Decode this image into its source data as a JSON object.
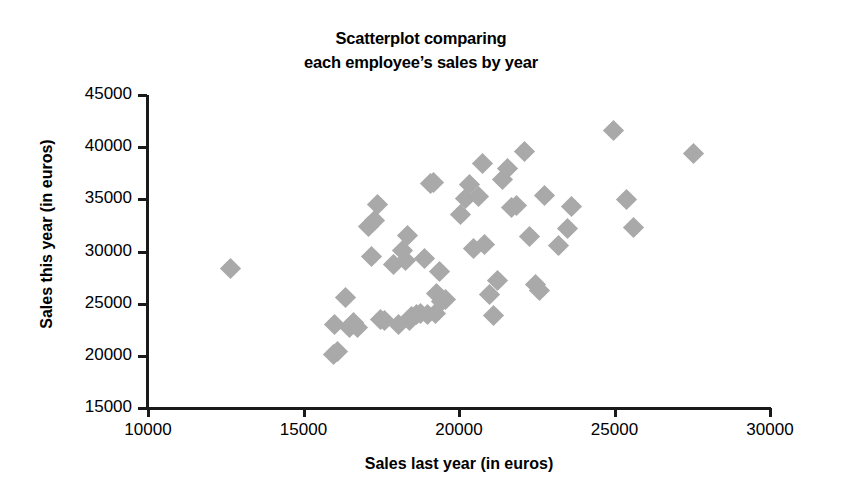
{
  "chart_data": {
    "type": "scatter",
    "title_lines": [
      "Scatterplot comparing",
      "each employee’s sales by year"
    ],
    "xlabel": "Sales last year (in euros)",
    "ylabel": "Sales this year (in euros)",
    "xlim": [
      10000,
      30000
    ],
    "ylim": [
      15000,
      45000
    ],
    "xticks": [
      10000,
      15000,
      20000,
      25000,
      30000
    ],
    "yticks": [
      15000,
      20000,
      25000,
      30000,
      35000,
      40000,
      45000
    ],
    "xticklabels": [
      "10000",
      "15000",
      "20000",
      "25000",
      "30000"
    ],
    "yticklabels": [
      "15000",
      "20000",
      "25000",
      "30000",
      "35000",
      "40000",
      "45000"
    ],
    "grid": false,
    "legend": null,
    "marker": "diamond",
    "marker_color": "#a9a9a9",
    "marker_size": 15,
    "n_points": 57,
    "x": [
      12640,
      15980,
      16010,
      16080,
      16340,
      16480,
      16620,
      16750,
      17100,
      17200,
      17290,
      17390,
      17480,
      17620,
      17900,
      18050,
      18180,
      18290,
      18340,
      18400,
      18480,
      18620,
      18750,
      18900,
      19000,
      19080,
      19180,
      19230,
      19290,
      19380,
      19450,
      19560,
      20050,
      20200,
      20340,
      20480,
      20620,
      20750,
      20820,
      20980,
      21100,
      21250,
      21400,
      21560,
      21700,
      21850,
      22100,
      22280,
      22450,
      22600,
      22750,
      23200,
      23480,
      23620,
      24980,
      25400,
      25620,
      27550
    ],
    "y": [
      28330,
      20150,
      23000,
      20400,
      25600,
      22700,
      23150,
      22750,
      32400,
      29500,
      33000,
      34500,
      23500,
      23350,
      28800,
      23050,
      30100,
      29100,
      31500,
      23400,
      23800,
      23950,
      24100,
      29350,
      24000,
      36500,
      36650,
      24050,
      26000,
      28100,
      25250,
      25400,
      33500,
      35100,
      36400,
      30250,
      35250,
      38400,
      30650,
      25900,
      23850,
      27200,
      36900,
      37950,
      34200,
      34400,
      39600,
      31400,
      26800,
      26300,
      35400,
      30600,
      32200,
      34300,
      41550,
      35000,
      32300,
      39440
    ],
    "points": [
      {
        "x": 12640,
        "y": 28330
      },
      {
        "x": 15980,
        "y": 20150
      },
      {
        "x": 16010,
        "y": 23000
      },
      {
        "x": 16080,
        "y": 20400
      },
      {
        "x": 16340,
        "y": 25600
      },
      {
        "x": 16480,
        "y": 22700
      },
      {
        "x": 16620,
        "y": 23150
      },
      {
        "x": 16750,
        "y": 22750
      },
      {
        "x": 17100,
        "y": 32400
      },
      {
        "x": 17200,
        "y": 29500
      },
      {
        "x": 17290,
        "y": 33000
      },
      {
        "x": 17390,
        "y": 34500
      },
      {
        "x": 17480,
        "y": 23500
      },
      {
        "x": 17620,
        "y": 23350
      },
      {
        "x": 17900,
        "y": 28800
      },
      {
        "x": 18050,
        "y": 23050
      },
      {
        "x": 18180,
        "y": 30100
      },
      {
        "x": 18290,
        "y": 29100
      },
      {
        "x": 18340,
        "y": 31500
      },
      {
        "x": 18400,
        "y": 23400
      },
      {
        "x": 18480,
        "y": 23800
      },
      {
        "x": 18620,
        "y": 23950
      },
      {
        "x": 18750,
        "y": 24100
      },
      {
        "x": 18900,
        "y": 29350
      },
      {
        "x": 19000,
        "y": 24000
      },
      {
        "x": 19080,
        "y": 36500
      },
      {
        "x": 19180,
        "y": 36650
      },
      {
        "x": 19230,
        "y": 24050
      },
      {
        "x": 19290,
        "y": 26000
      },
      {
        "x": 19380,
        "y": 28100
      },
      {
        "x": 19450,
        "y": 25250
      },
      {
        "x": 19560,
        "y": 25400
      },
      {
        "x": 20050,
        "y": 33500
      },
      {
        "x": 20200,
        "y": 35100
      },
      {
        "x": 20340,
        "y": 36400
      },
      {
        "x": 20480,
        "y": 30250
      },
      {
        "x": 20620,
        "y": 35250
      },
      {
        "x": 20750,
        "y": 38400
      },
      {
        "x": 20820,
        "y": 30650
      },
      {
        "x": 20980,
        "y": 25900
      },
      {
        "x": 21100,
        "y": 23850
      },
      {
        "x": 21250,
        "y": 27200
      },
      {
        "x": 21400,
        "y": 36900
      },
      {
        "x": 21560,
        "y": 37950
      },
      {
        "x": 21700,
        "y": 34200
      },
      {
        "x": 21850,
        "y": 34400
      },
      {
        "x": 22100,
        "y": 39600
      },
      {
        "x": 22280,
        "y": 31400
      },
      {
        "x": 22450,
        "y": 26800
      },
      {
        "x": 22600,
        "y": 26300
      },
      {
        "x": 22750,
        "y": 35400
      },
      {
        "x": 23200,
        "y": 30600
      },
      {
        "x": 23480,
        "y": 32200
      },
      {
        "x": 23620,
        "y": 34300
      },
      {
        "x": 24980,
        "y": 41550
      },
      {
        "x": 25400,
        "y": 35000
      },
      {
        "x": 25620,
        "y": 32300
      },
      {
        "x": 27550,
        "y": 39440
      }
    ]
  }
}
